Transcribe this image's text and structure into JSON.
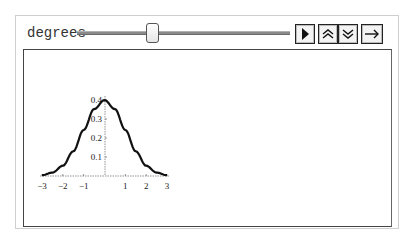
{
  "controls": {
    "parameter_label": "degrees",
    "slider": {
      "value_position_fraction": 0.34
    },
    "buttons": {
      "play": {
        "icon": "play-icon"
      },
      "faster": {
        "icon": "double-chevron-up-icon"
      },
      "slower": {
        "icon": "double-chevron-down-icon"
      },
      "direction": {
        "icon": "arrow-right-icon"
      }
    }
  },
  "chart_data": {
    "type": "line",
    "title": "",
    "xlabel": "",
    "ylabel": "",
    "xlim": [
      -3,
      3
    ],
    "ylim": [
      0,
      0.4
    ],
    "x_ticks": [
      "−3",
      "−2",
      "−1",
      "1",
      "2",
      "3"
    ],
    "y_ticks": [
      "0.1",
      "0.2",
      "0.3",
      "0.4"
    ],
    "grid": false,
    "legend": null,
    "series": [
      {
        "name": "density",
        "x": [
          -3,
          -2.5,
          -2,
          -1.5,
          -1,
          -0.5,
          0,
          0.5,
          1,
          1.5,
          2,
          2.5,
          3
        ],
        "values": [
          0.004,
          0.018,
          0.054,
          0.13,
          0.242,
          0.352,
          0.399,
          0.352,
          0.242,
          0.13,
          0.054,
          0.018,
          0.004
        ]
      }
    ]
  }
}
